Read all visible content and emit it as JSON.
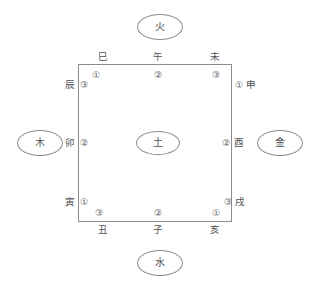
{
  "diagram": {
    "center": {
      "label": "土",
      "name": "earth"
    },
    "elements": [
      {
        "label": "火",
        "position": "top",
        "name": "fire"
      },
      {
        "label": "木",
        "position": "left",
        "name": "wood"
      },
      {
        "label": "金",
        "position": "right",
        "name": "metal"
      },
      {
        "label": "水",
        "position": "bottom",
        "name": "water"
      }
    ],
    "top_edge": {
      "branches": [
        {
          "label": "巳",
          "number": "①"
        },
        {
          "label": "午",
          "number": "②"
        },
        {
          "label": "未",
          "number": "③"
        }
      ]
    },
    "right_edge": {
      "branches": [
        {
          "label": "申",
          "number": "①"
        },
        {
          "label": "酉",
          "number": "②"
        },
        {
          "label": "戌",
          "number": "③"
        }
      ]
    },
    "bottom_edge": {
      "branches": [
        {
          "label": "亥",
          "number": "①"
        },
        {
          "label": "子",
          "number": "②"
        },
        {
          "label": "丑",
          "number": "③"
        }
      ]
    },
    "left_edge": {
      "branches": [
        {
          "label": "寅",
          "number": "①"
        },
        {
          "label": "卯",
          "number": "②"
        },
        {
          "label": "辰",
          "number": "③"
        }
      ]
    },
    "colors": {
      "stroke": "#8c8c90",
      "text": "#4f4f54",
      "background": "#ffffff"
    }
  }
}
